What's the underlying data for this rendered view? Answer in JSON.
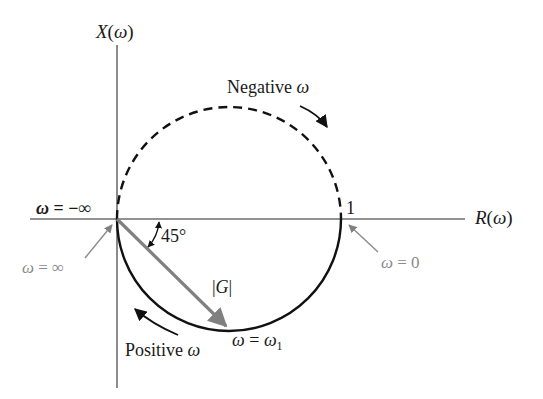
{
  "diagram": {
    "axes": {
      "vertical_label": "X(ω)",
      "horizontal_label": "R(ω)",
      "unit_tick_label": "1"
    },
    "labels": {
      "negative_omega": "Negative ω",
      "positive_omega": "Positive ω",
      "omega_neg_inf": "ω = −∞",
      "omega_pos_inf": "ω = ∞",
      "omega_zero": "ω = 0",
      "omega_one": "ω = ω",
      "omega_one_sub": "1",
      "magnitude": "|G|",
      "angle": "45°"
    },
    "colors": {
      "curve": "#111111",
      "axis": "#6e6e6e",
      "vector": "#808080",
      "annotation_grey": "#8a8a8a"
    },
    "geometry": {
      "circle_center": [
        229,
        219
      ],
      "circle_radius": 112,
      "upper_half_style": "dashed",
      "lower_half_style": "solid"
    }
  }
}
